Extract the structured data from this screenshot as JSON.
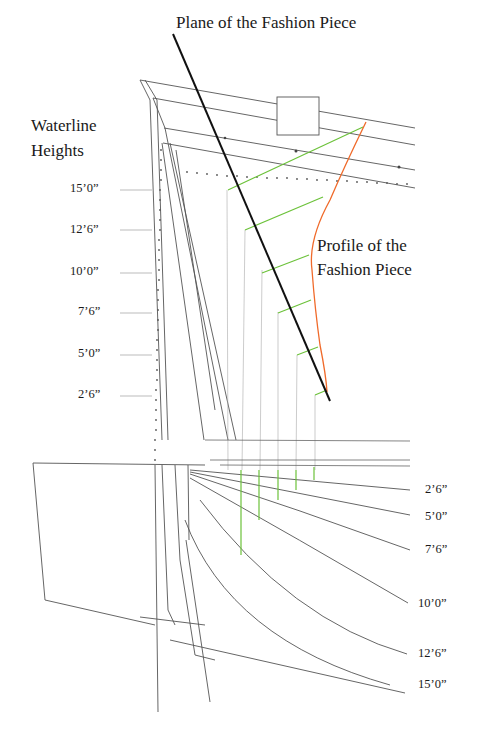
{
  "titles": {
    "plane": "Plane of the Fashion Piece",
    "waterline_1": "Waterline",
    "waterline_2": "Heights",
    "profile_1": "Profile of the",
    "profile_2": "Fashion Piece"
  },
  "left_ticks": [
    {
      "label": "15’0”",
      "y": 190
    },
    {
      "label": "12’6”",
      "y": 230
    },
    {
      "label": "10’0”",
      "y": 273
    },
    {
      "label": "7’6”",
      "y": 313
    },
    {
      "label": "5’0”",
      "y": 355
    },
    {
      "label": "2’6”",
      "y": 396
    }
  ],
  "right_ticks": [
    {
      "label": "2’6”",
      "y": 490
    },
    {
      "label": "5’0”",
      "y": 517
    },
    {
      "label": "7’6”",
      "y": 550
    },
    {
      "label": "10’0”",
      "y": 603
    },
    {
      "label": "12’6”",
      "y": 654
    },
    {
      "label": "15’0”",
      "y": 685
    }
  ],
  "colors": {
    "line": "#555555",
    "plane": "#111111",
    "profile": "#f06a2a",
    "green": "#6cc23a",
    "faint": "#9a9a9a"
  }
}
